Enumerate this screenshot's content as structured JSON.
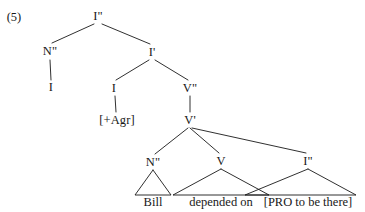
{
  "figure": {
    "example_number": "(5)",
    "type": "syntax-tree",
    "ink_color": "#181818",
    "background_color": "#ffffff"
  },
  "nodes": [
    {
      "id": "ip-root",
      "label": "I\"",
      "x": 98,
      "y": 16,
      "kind": "phrase"
    },
    {
      "id": "np-subject",
      "label": "N\"",
      "x": 50,
      "y": 51,
      "kind": "phrase"
    },
    {
      "id": "ibar",
      "label": "I'",
      "x": 152,
      "y": 52,
      "kind": "bar"
    },
    {
      "id": "n-subject",
      "label": "I",
      "x": 51,
      "y": 87,
      "kind": "terminal"
    },
    {
      "id": "i-head",
      "label": "I",
      "x": 114,
      "y": 88,
      "kind": "head"
    },
    {
      "id": "vp",
      "label": "V\"",
      "x": 190,
      "y": 88,
      "kind": "phrase"
    },
    {
      "id": "agr",
      "label": "[+Agr]",
      "x": 117,
      "y": 120,
      "kind": "feature"
    },
    {
      "id": "vbar",
      "label": "V'",
      "x": 190,
      "y": 120,
      "kind": "bar"
    },
    {
      "id": "np-object",
      "label": "N\"",
      "x": 153,
      "y": 162,
      "kind": "phrase"
    },
    {
      "id": "v-head",
      "label": "V",
      "x": 221,
      "y": 161,
      "kind": "head"
    },
    {
      "id": "ip-embedded",
      "label": "I\"",
      "x": 308,
      "y": 161,
      "kind": "phrase"
    }
  ],
  "leaves": [
    {
      "id": "leaf-bill",
      "label": "Bill",
      "x": 153,
      "y": 202,
      "parent": "np-object",
      "triangle": true,
      "half_width": 18
    },
    {
      "id": "leaf-verb",
      "label": "depended on",
      "x": 221,
      "y": 202,
      "parent": "v-head",
      "triangle": true,
      "half_width": 48
    },
    {
      "id": "leaf-clause",
      "label": "[PRO to be there]",
      "x": 308,
      "y": 202,
      "parent": "ip-embedded",
      "triangle": true,
      "half_width": 63
    }
  ],
  "edges": [
    {
      "from": "ip-root",
      "to": "np-subject",
      "style": "branch"
    },
    {
      "from": "ip-root",
      "to": "ibar",
      "style": "branch"
    },
    {
      "from": "np-subject",
      "to": "n-subject",
      "style": "vertical"
    },
    {
      "from": "ibar",
      "to": "i-head",
      "style": "branch"
    },
    {
      "from": "ibar",
      "to": "vp",
      "style": "branch"
    },
    {
      "from": "i-head",
      "to": "agr",
      "style": "vertical"
    },
    {
      "from": "vp",
      "to": "vbar",
      "style": "vertical"
    },
    {
      "from": "vbar",
      "to": "np-object",
      "style": "branch"
    },
    {
      "from": "vbar",
      "to": "v-head",
      "style": "branch"
    },
    {
      "from": "vbar",
      "to": "ip-embedded",
      "style": "branch"
    }
  ]
}
